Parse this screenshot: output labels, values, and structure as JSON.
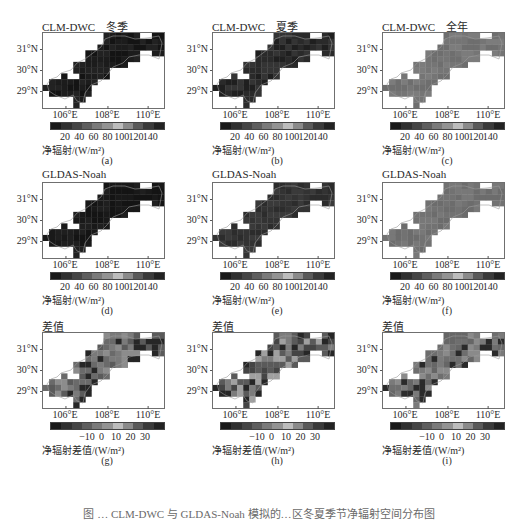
{
  "figure": {
    "caption": "图 … CLM-DWC 与 GLDAS-Noah 模拟的…区冬夏季节净辐射空间分布图",
    "lat_labels": [
      "31°N",
      "30°N",
      "29°N"
    ],
    "lon_labels": [
      "106°E",
      "108°E",
      "110°E"
    ],
    "colorbar_abs": {
      "ticks": [
        "20",
        "40",
        "60",
        "80",
        "100",
        "120",
        "140"
      ],
      "unit": "净辐射/(W/m²)",
      "colors": [
        "#1a1a1a",
        "#303030",
        "#454545",
        "#5e5e5e",
        "#7a7a7a",
        "#939393",
        "#bcbcbc",
        "#8a8a8a",
        "#5a5a5a",
        "#3a3a3a",
        "#222222"
      ]
    },
    "colorbar_diff": {
      "ticks": [
        "−10",
        "0",
        "10",
        "20",
        "30"
      ],
      "unit": "净辐射差值/(W/m²)",
      "colors": [
        "#1a1a1a",
        "#303030",
        "#454545",
        "#5e5e5e",
        "#7a7a7a",
        "#939393",
        "#bcbcbc",
        "#8a8a8a",
        "#5a5a5a",
        "#3a3a3a",
        "#222222"
      ]
    }
  },
  "chart_data": [
    {
      "type": "heatmap",
      "panel": "(a)",
      "title": "CLM-DWC    冬季",
      "model": "CLM-DWC",
      "period": "冬季",
      "dominant_value_range": "0-20 W/m²",
      "colorbar_label": "净辐射/(W/m²)",
      "colorbar_ticks": [
        20,
        40,
        60,
        80,
        100,
        120,
        140
      ],
      "xlabel_ticks": [
        "106°E",
        "108°E",
        "110°E"
      ],
      "ylabel_ticks": [
        "31°N",
        "30°N",
        "29°N"
      ]
    },
    {
      "type": "heatmap",
      "panel": "(b)",
      "title": "CLM-DWC    夏季",
      "model": "CLM-DWC",
      "period": "夏季",
      "dominant_value_range": "120-140 W/m²",
      "colorbar_label": "净辐射/(W/m²)",
      "colorbar_ticks": [
        20,
        40,
        60,
        80,
        100,
        120,
        140
      ],
      "xlabel_ticks": [
        "106°E",
        "108°E",
        "110°E"
      ],
      "ylabel_ticks": [
        "31°N",
        "30°N",
        "29°N"
      ]
    },
    {
      "type": "heatmap",
      "panel": "(c)",
      "title": "CLM-DWC    全年",
      "model": "CLM-DWC",
      "period": "全年",
      "dominant_value_range": "60-80 W/m²",
      "colorbar_label": "净辐射/(W/m²)",
      "colorbar_ticks": [
        20,
        40,
        60,
        80,
        100,
        120,
        140
      ],
      "xlabel_ticks": [
        "106°E",
        "108°E",
        "110°E"
      ],
      "ylabel_ticks": [
        "31°N",
        "30°N",
        "29°N"
      ]
    },
    {
      "type": "heatmap",
      "panel": "(d)",
      "title": "GLDAS-Noah",
      "model": "GLDAS-Noah",
      "period": "冬季",
      "dominant_value_range": "0-20 W/m²",
      "colorbar_label": "净辐射/(W/m²)",
      "colorbar_ticks": [
        20,
        40,
        60,
        80,
        100,
        120,
        140
      ],
      "xlabel_ticks": [
        "106°E",
        "108°E",
        "110°E"
      ],
      "ylabel_ticks": [
        "31°N",
        "30°N",
        "29°N"
      ]
    },
    {
      "type": "heatmap",
      "panel": "(e)",
      "title": "GLDAS-Noah",
      "model": "GLDAS-Noah",
      "period": "夏季",
      "dominant_value_range": "120-140 W/m²",
      "colorbar_label": "净辐射/(W/m²)",
      "colorbar_ticks": [
        20,
        40,
        60,
        80,
        100,
        120,
        140
      ],
      "xlabel_ticks": [
        "106°E",
        "108°E",
        "110°E"
      ],
      "ylabel_ticks": [
        "31°N",
        "30°N",
        "29°N"
      ]
    },
    {
      "type": "heatmap",
      "panel": "(f)",
      "title": "GLDAS-Noah",
      "model": "GLDAS-Noah",
      "period": "全年",
      "dominant_value_range": "60-80 W/m²",
      "colorbar_label": "净辐射/(W/m²)",
      "colorbar_ticks": [
        20,
        40,
        60,
        80,
        100,
        120,
        140
      ],
      "xlabel_ticks": [
        "106°E",
        "108°E",
        "110°E"
      ],
      "ylabel_ticks": [
        "31°N",
        "30°N",
        "29°N"
      ]
    },
    {
      "type": "heatmap",
      "panel": "(g)",
      "title": "差值",
      "period": "冬季",
      "dominant_value_range": "0-10 W/m², darker (-10 or 30) cells in NE",
      "colorbar_label": "净辐射差值/(W/m²)",
      "colorbar_ticks": [
        -10,
        0,
        10,
        20,
        30
      ],
      "xlabel_ticks": [
        "106°E",
        "108°E",
        "110°E"
      ],
      "ylabel_ticks": [
        "31°N",
        "30°N",
        "29°N"
      ]
    },
    {
      "type": "heatmap",
      "panel": "(h)",
      "title": "差值",
      "period": "夏季",
      "dominant_value_range": "mixed -10 to 30 W/m²",
      "colorbar_label": "净辐射差值/(W/m²)",
      "colorbar_ticks": [
        -10,
        0,
        10,
        20,
        30
      ],
      "xlabel_ticks": [
        "106°E",
        "108°E",
        "110°E"
      ],
      "ylabel_ticks": [
        "31°N",
        "30°N",
        "29°N"
      ]
    },
    {
      "type": "heatmap",
      "panel": "(i)",
      "title": "差值",
      "period": "全年",
      "dominant_value_range": "0-10 W/m²",
      "colorbar_label": "净辐射差值/(W/m²)",
      "colorbar_ticks": [
        -10,
        0,
        10,
        20,
        30
      ],
      "xlabel_ticks": [
        "106°E",
        "108°E",
        "110°E"
      ],
      "ylabel_ticks": [
        "31°N",
        "30°N",
        "29°N"
      ]
    }
  ],
  "panels": [
    {
      "title": "CLM-DWC    冬季",
      "label": "(a)",
      "bar": "abs",
      "fill": [
        "#141414",
        "#1c1c1c",
        "#222222"
      ]
    },
    {
      "title": "CLM-DWC    夏季",
      "label": "(b)",
      "bar": "abs",
      "fill": [
        "#1f1f1f",
        "#2a2a2a",
        "#343434"
      ]
    },
    {
      "title": "CLM-DWC    全年",
      "label": "(c)",
      "bar": "abs",
      "fill": [
        "#6e6e6e",
        "#757575",
        "#7c7c7c"
      ]
    },
    {
      "title": "GLDAS-Noah",
      "label": "(d)",
      "bar": "abs",
      "fill": [
        "#141414",
        "#191919",
        "#1f1f1f"
      ]
    },
    {
      "title": "GLDAS-Noah",
      "label": "(e)",
      "bar": "abs",
      "fill": [
        "#2c2c2c",
        "#333333",
        "#3a3a3a"
      ]
    },
    {
      "title": "GLDAS-Noah",
      "label": "(f)",
      "bar": "abs",
      "fill": [
        "#6c6c6c",
        "#727272",
        "#787878"
      ]
    },
    {
      "title": "差值",
      "label": "(g)",
      "bar": "diff",
      "fill": [
        "#6a6a6a",
        "#7a7a7a",
        "#5a5a5a",
        "#262626",
        "#8c8c8c"
      ]
    },
    {
      "title": "差值",
      "label": "(h)",
      "bar": "diff",
      "fill": [
        "#5a5a5a",
        "#7c7c7c",
        "#262626",
        "#a0a0a0",
        "#454545"
      ]
    },
    {
      "title": "差值",
      "label": "(i)",
      "bar": "diff",
      "fill": [
        "#6e6e6e",
        "#7a7a7a",
        "#666666",
        "#8a8a8a",
        "#2a2a2a"
      ]
    }
  ]
}
